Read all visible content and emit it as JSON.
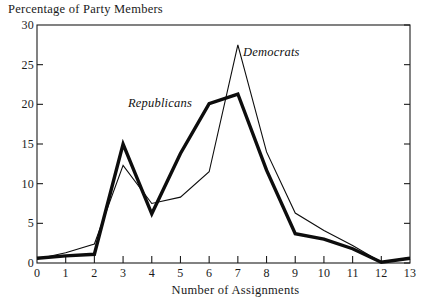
{
  "chart_data": {
    "type": "line",
    "title": "Percentage of Party Members",
    "xlabel": "Number of Assignments",
    "ylabel": "Percentage of Party Members",
    "grid": false,
    "legend_position": "inline-annotations",
    "xlim": [
      0,
      13
    ],
    "ylim": [
      0,
      30
    ],
    "xticks": [
      0,
      1,
      2,
      3,
      4,
      5,
      6,
      7,
      8,
      9,
      10,
      11,
      12,
      13
    ],
    "yticks": [
      0,
      5,
      10,
      15,
      20,
      25,
      30
    ],
    "x": [
      0,
      1,
      2,
      3,
      4,
      5,
      6,
      7,
      8,
      9,
      10,
      11,
      12,
      13
    ],
    "series": [
      {
        "name": "Republicans",
        "style": "thick",
        "stroke_width": 3.4,
        "color": "#0d0d0d",
        "values": [
          0.6,
          0.9,
          1.1,
          15.0,
          6.2,
          13.8,
          20.1,
          21.3,
          11.7,
          3.7,
          3.0,
          1.8,
          0.1,
          0.6
        ]
      },
      {
        "name": "Democrats",
        "style": "thin",
        "stroke_width": 1.1,
        "color": "#0d0d0d",
        "values": [
          0.5,
          1.3,
          2.4,
          12.3,
          7.5,
          8.3,
          11.5,
          27.5,
          14.0,
          6.3,
          4.1,
          2.2,
          0.1,
          0.7
        ]
      }
    ],
    "annotations": [
      {
        "text": "Republicans",
        "x_px": 128,
        "y_px": 96
      },
      {
        "text": "Democrats",
        "x_px": 243,
        "y_px": 45
      }
    ]
  },
  "colors": {
    "axis": "#1c1c1c",
    "line": "#0d0d0d",
    "background": "#ffffff"
  }
}
